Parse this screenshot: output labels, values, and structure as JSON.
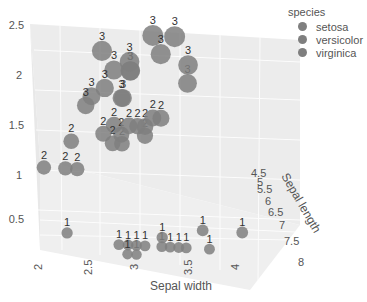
{
  "chart_data": {
    "type": "scatter3d",
    "title": "",
    "x_axis": {
      "label": "Sepal width",
      "ticks": [
        "2",
        "2.5",
        "3",
        "3.5",
        "4"
      ],
      "range": [
        2,
        4.4
      ]
    },
    "y_axis": {
      "label": "Sepal length",
      "ticks": [
        "4.5",
        "5",
        "5.5",
        "6",
        "6.5",
        "7",
        "7.5",
        "8"
      ],
      "range": [
        4.3,
        7.9
      ]
    },
    "z_axis": {
      "label": "",
      "ticks": [
        "0.5",
        "1",
        "1.5",
        "2",
        "2.5"
      ],
      "range": [
        0.1,
        2.5
      ]
    },
    "legend": {
      "title": "species",
      "entries": [
        "setosa",
        "versicolor",
        "virginica"
      ],
      "position": "top-right"
    },
    "marker_color": "#7f7f7f",
    "text_labels": {
      "setosa": "1",
      "versicolor": "2",
      "virginica": "3"
    },
    "series": [
      {
        "name": "setosa",
        "label": "1",
        "points_sample": [
          [
            3.5,
            5.1,
            0.2
          ],
          [
            3.0,
            4.9,
            0.2
          ],
          [
            3.2,
            4.7,
            0.2
          ],
          [
            3.1,
            4.6,
            0.2
          ],
          [
            3.6,
            5.0,
            0.2
          ],
          [
            3.9,
            5.4,
            0.4
          ],
          [
            3.4,
            4.6,
            0.3
          ],
          [
            3.4,
            5.0,
            0.2
          ],
          [
            2.9,
            4.4,
            0.2
          ],
          [
            3.1,
            4.9,
            0.1
          ],
          [
            3.7,
            5.4,
            0.2
          ],
          [
            4.0,
            5.8,
            0.2
          ],
          [
            4.4,
            5.7,
            0.4
          ],
          [
            3.0,
            4.3,
            0.1
          ],
          [
            2.3,
            4.5,
            0.3
          ]
        ]
      },
      {
        "name": "versicolor",
        "label": "2",
        "points_sample": [
          [
            3.2,
            7.0,
            1.4
          ],
          [
            3.2,
            6.4,
            1.5
          ],
          [
            3.1,
            6.9,
            1.5
          ],
          [
            2.3,
            5.5,
            1.3
          ],
          [
            2.8,
            6.5,
            1.5
          ],
          [
            2.8,
            5.7,
            1.3
          ],
          [
            3.3,
            6.3,
            1.6
          ],
          [
            2.4,
            4.9,
            1.0
          ],
          [
            2.9,
            6.6,
            1.3
          ],
          [
            2.7,
            5.2,
            1.4
          ],
          [
            2.0,
            5.0,
            1.0
          ],
          [
            3.0,
            5.9,
            1.5
          ],
          [
            2.2,
            6.0,
            1.0
          ],
          [
            2.9,
            6.1,
            1.4
          ],
          [
            3.4,
            6.0,
            1.6
          ]
        ]
      },
      {
        "name": "virginica",
        "label": "3",
        "points_sample": [
          [
            3.3,
            6.3,
            2.5
          ],
          [
            2.7,
            5.8,
            1.9
          ],
          [
            3.0,
            7.1,
            2.1
          ],
          [
            2.9,
            6.3,
            1.8
          ],
          [
            3.0,
            6.5,
            2.2
          ],
          [
            3.0,
            7.6,
            2.1
          ],
          [
            2.5,
            4.9,
            1.7
          ],
          [
            2.9,
            7.3,
            1.8
          ],
          [
            2.5,
            6.7,
            1.8
          ],
          [
            3.6,
            7.2,
            2.5
          ],
          [
            3.8,
            7.7,
            2.2
          ],
          [
            2.6,
            7.7,
            2.3
          ],
          [
            3.8,
            7.9,
            2.0
          ],
          [
            2.8,
            6.4,
            2.1
          ],
          [
            3.4,
            6.2,
            2.3
          ]
        ]
      }
    ]
  }
}
